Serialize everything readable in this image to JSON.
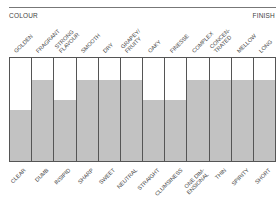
{
  "header": {
    "left_label": "COLOUR",
    "right_label": "FINISH"
  },
  "columns": [
    {
      "top": "GOLDEN",
      "bottom": "CLEAR",
      "fill_pct": 50
    },
    {
      "top": "FRAGRANT",
      "bottom": "DUMB",
      "fill_pct": 79
    },
    {
      "top": "STRONG\nFLAVOUR",
      "bottom": "INSIPID",
      "fill_pct": 59
    },
    {
      "top": "SMOOTH",
      "bottom": "SHARP",
      "fill_pct": 79
    },
    {
      "top": "DRY",
      "bottom": "SWEET",
      "fill_pct": 79
    },
    {
      "top": "GRAPEY/\nFRUITY",
      "bottom": "NEUTRAL",
      "fill_pct": 79
    },
    {
      "top": "OAKY",
      "bottom": "STRAIGHT",
      "fill_pct": 59
    },
    {
      "top": "FINESSE",
      "bottom": "CLUMSINESS",
      "fill_pct": 59
    },
    {
      "top": "COMPLEX",
      "bottom": "ONE DIM-\nENSIONAL",
      "fill_pct": 79
    },
    {
      "top": "CONCEN-\nTRATED",
      "bottom": "THIN",
      "fill_pct": 79
    },
    {
      "top": "MELLOW",
      "bottom": "SPIRITY",
      "fill_pct": 79
    },
    {
      "top": "LONG",
      "bottom": "SHORT",
      "fill_pct": 79
    }
  ],
  "colors": {
    "fill": "#c2c2c2",
    "border": "#555555",
    "background": "#ffffff"
  },
  "chart_data": {
    "type": "bar",
    "title": "",
    "categories": [
      "GOLDEN / CLEAR",
      "FRAGRANT / DUMB",
      "STRONG FLAVOUR / INSIPID",
      "SMOOTH / SHARP",
      "DRY / SWEET",
      "GRAPEY/FRUITY / NEUTRAL",
      "OAKY / STRAIGHT",
      "FINESSE / CLUMSINESS",
      "COMPLEX / ONE DIMENSIONAL",
      "CONCENTRATED / THIN",
      "MELLOW / SPIRITY",
      "LONG / SHORT"
    ],
    "top_labels": [
      "GOLDEN",
      "FRAGRANT",
      "STRONG FLAVOUR",
      "SMOOTH",
      "DRY",
      "GRAPEY/FRUITY",
      "OAKY",
      "FINESSE",
      "COMPLEX",
      "CONCENTRATED",
      "MELLOW",
      "LONG"
    ],
    "bottom_labels": [
      "CLEAR",
      "DUMB",
      "INSIPID",
      "SHARP",
      "SWEET",
      "NEUTRAL",
      "STRAIGHT",
      "CLUMSINESS",
      "ONE DIMENSIONAL",
      "THIN",
      "SPIRITY",
      "SHORT"
    ],
    "values": [
      50,
      79,
      59,
      79,
      79,
      79,
      59,
      59,
      79,
      79,
      79,
      79
    ],
    "xlabel": "",
    "ylabel": "",
    "ylim": [
      0,
      100
    ],
    "annotations": [
      "COLOUR",
      "FINISH"
    ],
    "grid": false,
    "legend": "none"
  }
}
